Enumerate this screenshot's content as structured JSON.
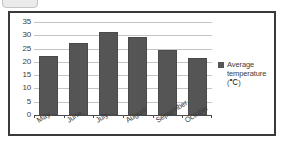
{
  "chart_data": {
    "type": "bar",
    "title": "",
    "xlabel": "",
    "ylabel": "",
    "categories": [
      "May",
      "June",
      "July",
      "August",
      "September",
      "October"
    ],
    "values": [
      22.2,
      27.1,
      31.1,
      29.3,
      24.3,
      21.5
    ],
    "series": [
      {
        "name": "Average temperature (℃)",
        "values": [
          22.2,
          27.1,
          31.1,
          29.3,
          24.3,
          21.5
        ]
      }
    ],
    "ylim": [
      0,
      35
    ],
    "yticks": [
      0,
      5,
      10,
      15,
      20,
      25,
      30,
      35
    ],
    "ytick_labels": [
      "0",
      "5",
      "10",
      "15",
      "20",
      "25",
      "30",
      "35"
    ],
    "grid": true,
    "legend_position": "right",
    "bar_color": "#555555",
    "gridline_color": "#c4c4c4",
    "axis_color": "#4a4a4a",
    "frame_color": "#3a3a3a"
  },
  "legend": {
    "entries": [
      {
        "label": "Average temperature (℃)",
        "color": "#555555"
      }
    ]
  }
}
